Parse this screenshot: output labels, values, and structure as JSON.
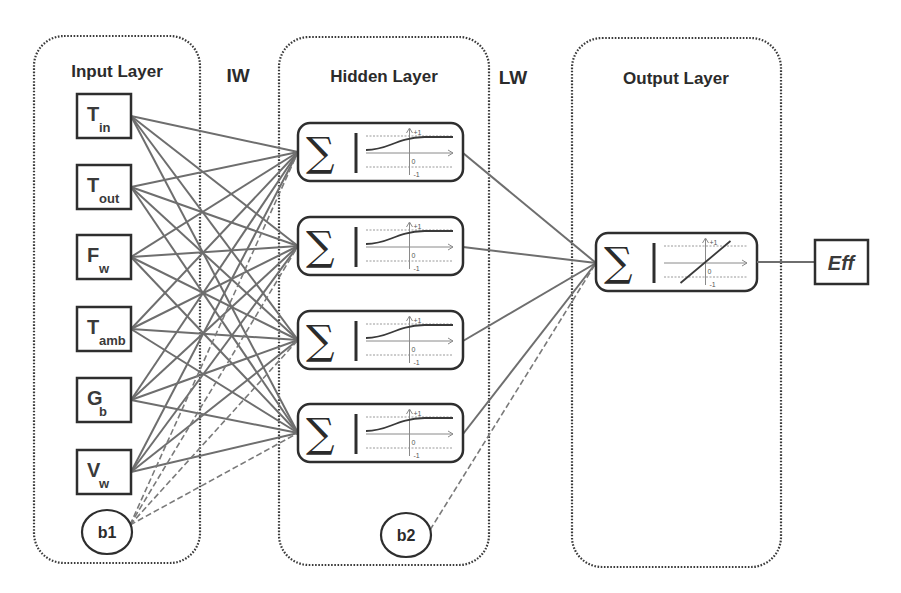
{
  "layers": {
    "input": {
      "title": "Input Layer"
    },
    "hidden": {
      "title": "Hidden Layer"
    },
    "output": {
      "title": "Output Layer"
    }
  },
  "weights": {
    "input_to_hidden": "IW",
    "hidden_to_output": "LW"
  },
  "inputs": [
    {
      "main": "T",
      "sub": "in"
    },
    {
      "main": "T",
      "sub": "out"
    },
    {
      "main": "F",
      "sub": "w"
    },
    {
      "main": "T",
      "sub": "amb"
    },
    {
      "main": "G",
      "sub": "b"
    },
    {
      "main": "V",
      "sub": "w"
    }
  ],
  "biases": {
    "b1": "b1",
    "b2": "b2"
  },
  "hidden_neurons": [
    {
      "symbol": "∑",
      "activation": "sigmoid",
      "tick_top": "+1",
      "tick_zero": "0",
      "tick_bottom": "-1"
    },
    {
      "symbol": "∑",
      "activation": "sigmoid",
      "tick_top": "+1",
      "tick_zero": "0",
      "tick_bottom": "-1"
    },
    {
      "symbol": "∑",
      "activation": "sigmoid",
      "tick_top": "+1",
      "tick_zero": "0",
      "tick_bottom": "-1"
    },
    {
      "symbol": "∑",
      "activation": "sigmoid",
      "tick_top": "+1",
      "tick_zero": "0",
      "tick_bottom": "-1"
    }
  ],
  "output_neuron": {
    "symbol": "∑",
    "activation": "linear",
    "tick_top": "+1",
    "tick_zero": "0",
    "tick_bottom": "-1"
  },
  "output": {
    "label": "Eff"
  },
  "colors": {
    "edge": "#6e6e6e",
    "border": "#2e2e2e",
    "text": "#2b2b2b"
  }
}
